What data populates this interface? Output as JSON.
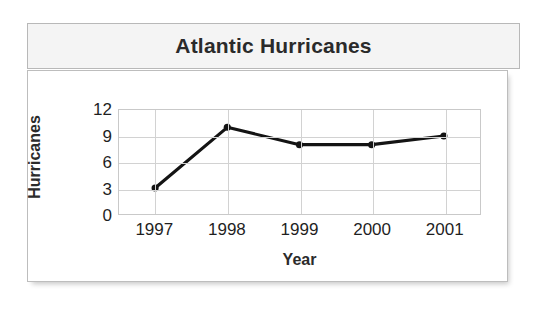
{
  "card": {
    "title": "Atlantic Hurricanes"
  },
  "chart_data": {
    "type": "line",
    "title": "Atlantic Hurricanes",
    "xlabel": "Year",
    "ylabel": "Hurricanes",
    "categories": [
      "1997",
      "1998",
      "1999",
      "2000",
      "2001"
    ],
    "values": [
      3,
      10,
      8,
      8,
      9
    ],
    "ylim": [
      0,
      12
    ],
    "yticks": [
      "0",
      "3",
      "6",
      "9",
      "12"
    ],
    "ytick_values": [
      0,
      3,
      6,
      9,
      12
    ],
    "grid": true,
    "legend": "none",
    "series_color": "#141414",
    "marker": "circle",
    "marker_color": "#141414"
  },
  "colors": {
    "title_panel": "#f4f4f4",
    "panel_border": "#b8b8b8",
    "grid": "#d2d2d2",
    "text": "#1f1f1f",
    "accent": "#141414"
  }
}
